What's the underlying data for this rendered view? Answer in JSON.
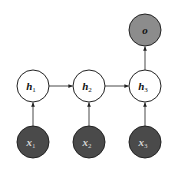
{
  "diagram": {
    "type": "rnn-many-to-one",
    "colors": {
      "background": "#ffffff",
      "stroke": "#222222",
      "hidden_fill": "#ffffff",
      "input_fill": "#4a4a4a",
      "output_fill": "#8c8c8c",
      "input_text": "#d8d8d8",
      "hidden_text": "#111111",
      "output_text": "#111111"
    },
    "nodes": {
      "output": {
        "id": "o",
        "base": "o",
        "sub": "",
        "cx": 145,
        "cy": 30
      },
      "hidden": [
        {
          "id": "h1",
          "base": "h",
          "sub": "1",
          "cx": 33,
          "cy": 86
        },
        {
          "id": "h2",
          "base": "h",
          "sub": "2",
          "cx": 89,
          "cy": 86
        },
        {
          "id": "h3",
          "base": "h",
          "sub": "3",
          "cx": 145,
          "cy": 86
        }
      ],
      "inputs": [
        {
          "id": "x1",
          "base": "x",
          "sub": "1",
          "cx": 33,
          "cy": 142
        },
        {
          "id": "x2",
          "base": "x",
          "sub": "2",
          "cx": 89,
          "cy": 142
        },
        {
          "id": "x3",
          "base": "x",
          "sub": "3",
          "cx": 145,
          "cy": 142
        }
      ]
    },
    "edges": [
      {
        "from": "x1",
        "to": "h1"
      },
      {
        "from": "x2",
        "to": "h2"
      },
      {
        "from": "x3",
        "to": "h3"
      },
      {
        "from": "h1",
        "to": "h2"
      },
      {
        "from": "h2",
        "to": "h3"
      },
      {
        "from": "h3",
        "to": "o"
      }
    ]
  }
}
